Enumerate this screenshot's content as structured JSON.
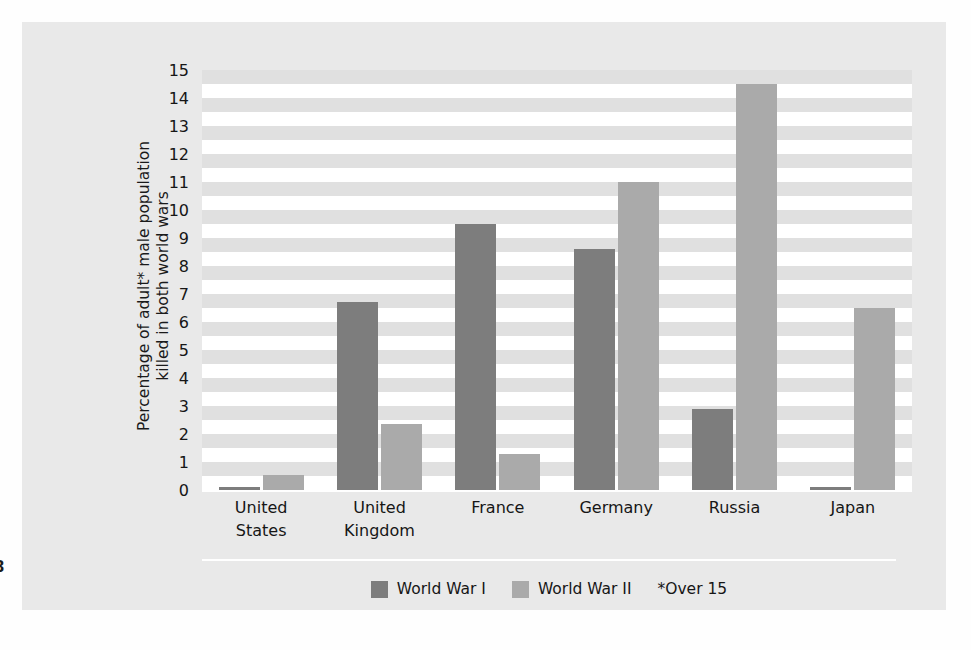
{
  "page": {
    "folio": "8",
    "panel_background": "#e9e9e9",
    "plot_background": "#ffffff",
    "band_color": "#e0e0e0"
  },
  "chart_data": {
    "type": "bar",
    "title": "",
    "xlabel": "",
    "ylabel": "Percentage of adult* male population killed in both world wars",
    "ylabel_lines": [
      "Percentage of adult* male population",
      "killed in both world wars"
    ],
    "categories": [
      "United States",
      "United Kingdom",
      "France",
      "Germany",
      "Russia",
      "Japan"
    ],
    "category_lines": [
      [
        "United",
        "States"
      ],
      [
        "United",
        "Kingdom"
      ],
      [
        "France"
      ],
      [
        "Germany"
      ],
      [
        "Russia"
      ],
      [
        "Japan"
      ]
    ],
    "series": [
      {
        "name": "World War I",
        "color": "#7d7d7d",
        "values": [
          0.1,
          6.7,
          9.5,
          8.6,
          2.9,
          0.05
        ]
      },
      {
        "name": "World War II",
        "color": "#aaaaaa",
        "values": [
          0.55,
          2.35,
          1.3,
          11.0,
          14.5,
          6.5
        ]
      }
    ],
    "ylim": [
      0,
      15
    ],
    "yticks": [
      "0",
      "1",
      "2",
      "3",
      "4",
      "5",
      "6",
      "7",
      "8",
      "9",
      "10",
      "11",
      "12",
      "13",
      "14",
      "15"
    ],
    "ytick_values": [
      0,
      1,
      2,
      3,
      4,
      5,
      6,
      7,
      8,
      9,
      10,
      11,
      12,
      13,
      14,
      15
    ],
    "grid": "alternating-horizontal-bands",
    "legend_position": "bottom-center",
    "annotation": "*Over 15"
  },
  "legend": {
    "items": [
      {
        "label": "World War I",
        "color": "#7d7d7d"
      },
      {
        "label": "World War II",
        "color": "#aaaaaa"
      }
    ],
    "note": "*Over 15"
  }
}
